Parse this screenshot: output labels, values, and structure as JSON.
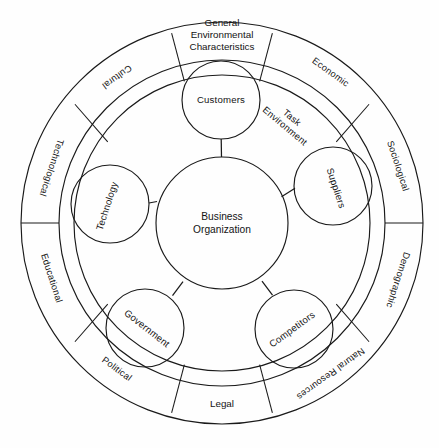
{
  "diagram": {
    "center": {
      "label_line1": "Business",
      "label_line2": "Organization"
    },
    "task_environment": {
      "label_line1": "Task",
      "label_line2": "Environment"
    },
    "general_environment_heading": {
      "line1": "General",
      "line2": "Environmental",
      "line3": "Characteristics"
    },
    "task_environment_elements": [
      {
        "name": "customers",
        "label": "Customers"
      },
      {
        "name": "suppliers",
        "label": "Suppliers"
      },
      {
        "name": "competitors",
        "label": "Competitors"
      },
      {
        "name": "government",
        "label": "Government"
      },
      {
        "name": "technology",
        "label": "Technology"
      }
    ],
    "general_environment_segments": [
      {
        "name": "general-environmental-characteristics",
        "label": "General Environmental Characteristics"
      },
      {
        "name": "economic",
        "label": "Economic"
      },
      {
        "name": "sociological",
        "label": "Sociological"
      },
      {
        "name": "demographic",
        "label": "Demographic"
      },
      {
        "name": "natural-resources",
        "label": "Natural Resources"
      },
      {
        "name": "legal",
        "label": "Legal"
      },
      {
        "name": "political",
        "label": "Political"
      },
      {
        "name": "educational",
        "label": "Educational"
      },
      {
        "name": "technological",
        "label": "Technological"
      },
      {
        "name": "cultural",
        "label": "Cultural"
      }
    ],
    "colors": {
      "stroke": "#1a1a1a",
      "background": "#fefefe",
      "text": "#131313"
    }
  }
}
